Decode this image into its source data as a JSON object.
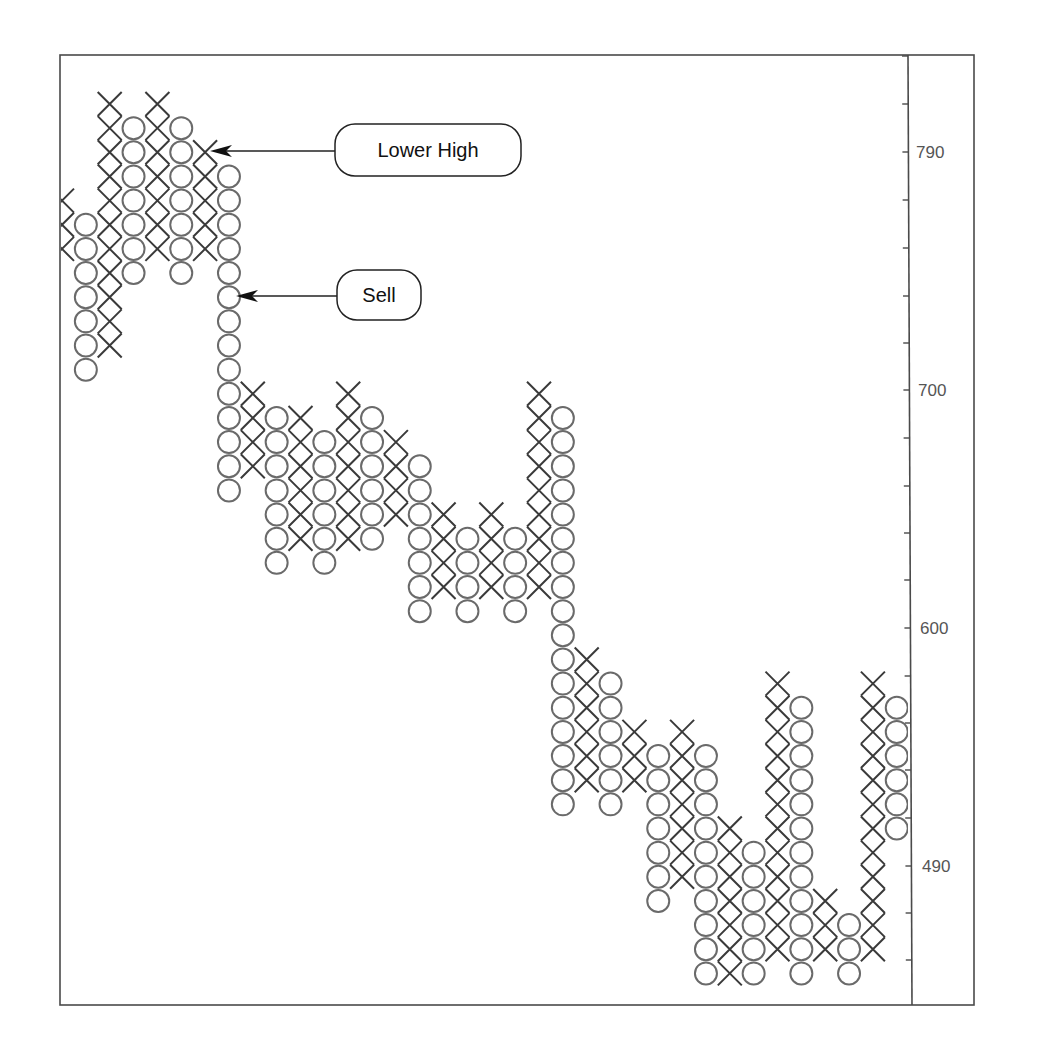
{
  "chart_data": {
    "type": "point-and-figure",
    "title": "",
    "xlabel": "",
    "ylabel": "",
    "y_axis_position": "right",
    "y_tick_labels": [
      {
        "label": "790",
        "y": 152
      },
      {
        "label": "700",
        "y": 390
      },
      {
        "label": "600",
        "y": 628
      },
      {
        "label": "490",
        "y": 866
      }
    ],
    "y_minor_ticks": [
      56,
      104,
      152,
      200,
      248,
      296,
      343,
      390,
      438,
      486,
      533,
      580,
      628,
      676,
      723,
      770,
      818,
      866,
      913,
      960
    ],
    "grid": false,
    "box_rows_note": "row 0 = highest box; each row is one box; values decrease downward",
    "columns": [
      {
        "type": "X",
        "from": 4,
        "to": 6
      },
      {
        "type": "O",
        "from": 5,
        "to": 11
      },
      {
        "type": "X",
        "from": 0,
        "to": 10
      },
      {
        "type": "O",
        "from": 1,
        "to": 7
      },
      {
        "type": "X",
        "from": 0,
        "to": 6
      },
      {
        "type": "O",
        "from": 1,
        "to": 7
      },
      {
        "type": "X",
        "from": 2,
        "to": 6
      },
      {
        "type": "O",
        "from": 3,
        "to": 16
      },
      {
        "type": "X",
        "from": 12,
        "to": 15
      },
      {
        "type": "O",
        "from": 13,
        "to": 19
      },
      {
        "type": "X",
        "from": 13,
        "to": 18
      },
      {
        "type": "O",
        "from": 14,
        "to": 19
      },
      {
        "type": "X",
        "from": 12,
        "to": 18
      },
      {
        "type": "O",
        "from": 13,
        "to": 18
      },
      {
        "type": "X",
        "from": 14,
        "to": 17
      },
      {
        "type": "O",
        "from": 15,
        "to": 21
      },
      {
        "type": "X",
        "from": 17,
        "to": 20
      },
      {
        "type": "O",
        "from": 18,
        "to": 21
      },
      {
        "type": "X",
        "from": 17,
        "to": 20
      },
      {
        "type": "O",
        "from": 18,
        "to": 21
      },
      {
        "type": "X",
        "from": 12,
        "to": 20
      },
      {
        "type": "O",
        "from": 13,
        "to": 29
      },
      {
        "type": "X",
        "from": 23,
        "to": 28
      },
      {
        "type": "O",
        "from": 24,
        "to": 29
      },
      {
        "type": "X",
        "from": 26,
        "to": 28
      },
      {
        "type": "O",
        "from": 27,
        "to": 33
      },
      {
        "type": "X",
        "from": 26,
        "to": 32
      },
      {
        "type": "O",
        "from": 27,
        "to": 36
      },
      {
        "type": "X",
        "from": 30,
        "to": 36
      },
      {
        "type": "O",
        "from": 31,
        "to": 36
      },
      {
        "type": "X",
        "from": 24,
        "to": 35
      },
      {
        "type": "O",
        "from": 25,
        "to": 36
      },
      {
        "type": "X",
        "from": 33,
        "to": 35
      },
      {
        "type": "O",
        "from": 34,
        "to": 36
      },
      {
        "type": "X",
        "from": 24,
        "to": 35
      },
      {
        "type": "O",
        "from": 25,
        "to": 30
      },
      {
        "type": "X",
        "from": 26,
        "to": 29
      }
    ],
    "annotations": [
      {
        "text": "Lower High",
        "target_column": 6,
        "target_row": 2
      },
      {
        "text": "Sell",
        "target_column": 7,
        "target_row": 8
      }
    ]
  },
  "annotations": {
    "lower_high": "Lower High",
    "sell": "Sell"
  },
  "axis": {
    "label_790": "790",
    "label_700": "700",
    "label_600": "600",
    "label_490": "490"
  }
}
